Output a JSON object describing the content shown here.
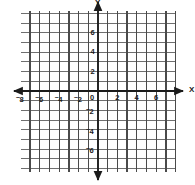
{
  "figure": {
    "kind": "cartesian-coordinate-grid",
    "background_color": "#ffffff",
    "grid_color": "#6f6f6f",
    "grid_vertical_color": "#4a4a4a",
    "axis_color": "#1b1b1b",
    "label_color": "#1b1b1b"
  },
  "axes": {
    "x_axis_label": "X",
    "y_axis_label": "Y",
    "origin_label": "0",
    "x_labels": [
      {
        "text": "8",
        "negative": true,
        "value": -8
      },
      {
        "text": "6",
        "negative": true,
        "value": -6
      },
      {
        "text": "4",
        "negative": true,
        "value": -4
      },
      {
        "text": "2",
        "negative": true,
        "value": -2
      },
      {
        "text": "2",
        "negative": false,
        "value": 2
      },
      {
        "text": "4",
        "negative": false,
        "value": 4
      },
      {
        "text": "6",
        "negative": false,
        "value": 6
      }
    ],
    "y_labels": [
      {
        "text": "6",
        "negative": false,
        "value": 6
      },
      {
        "text": "4",
        "negative": false,
        "value": 4
      },
      {
        "text": "2",
        "negative": false,
        "value": 2
      },
      {
        "text": "2",
        "negative": true,
        "value": -2
      },
      {
        "text": "4",
        "negative": true,
        "value": -4
      },
      {
        "text": "6",
        "negative": true,
        "value": -6
      }
    ]
  },
  "chart_data": {
    "type": "line",
    "title": "",
    "subtitle": "",
    "xlabel": "X",
    "ylabel": "Y",
    "xlim": [
      -8,
      8
    ],
    "ylim": [
      -8,
      8
    ],
    "xticks": [
      -8,
      -6,
      -4,
      -2,
      0,
      2,
      4,
      6
    ],
    "yticks": [
      -6,
      -4,
      -2,
      0,
      2,
      4,
      6
    ],
    "xtick_labels": [
      "⁻8",
      "⁻6",
      "⁻4",
      "⁻2",
      "0",
      "2",
      "4",
      "6"
    ],
    "ytick_labels": [
      "⁻6",
      "⁻4",
      "⁻2",
      "0",
      "2",
      "4",
      "6"
    ],
    "grid": true,
    "grid_step": 1,
    "legend": null,
    "legend_position": "none",
    "series": [],
    "annotations": [],
    "note": "Empty Cartesian grid: no plotted data points, lines, or shaded regions. Both axes drawn with arrowheads at each end."
  },
  "geometry": {
    "origin_x_px": 98,
    "origin_y_px": 91,
    "unit_px": 9.7,
    "grid_left_px": 21,
    "grid_right_px": 176,
    "grid_top_px": 11,
    "grid_bottom_px": 172
  }
}
